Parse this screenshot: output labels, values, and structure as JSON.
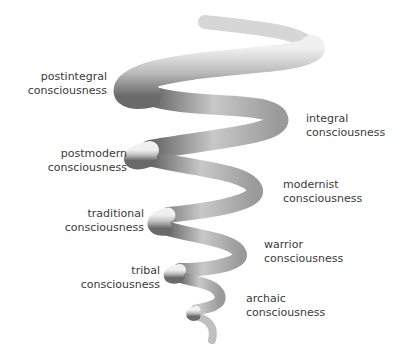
{
  "diagram": {
    "type": "spiral",
    "stages_left": [
      {
        "line1": "postintegral",
        "line2": "consciousness"
      },
      {
        "line1": "postmodern",
        "line2": "consciousness"
      },
      {
        "line1": "traditional",
        "line2": "consciousness"
      },
      {
        "line1": "tribal",
        "line2": "consciousness"
      }
    ],
    "stages_right": [
      {
        "line1": "integral",
        "line2": "consciousness"
      },
      {
        "line1": "modernist",
        "line2": "consciousness"
      },
      {
        "line1": "warrior",
        "line2": "consciousness"
      },
      {
        "line1": "archaic",
        "line2": "consciousness"
      }
    ],
    "colors": {
      "tube_light": "#e8e8e8",
      "tube_dark": "#6e6e6e",
      "text": "#3a3a3a"
    }
  }
}
